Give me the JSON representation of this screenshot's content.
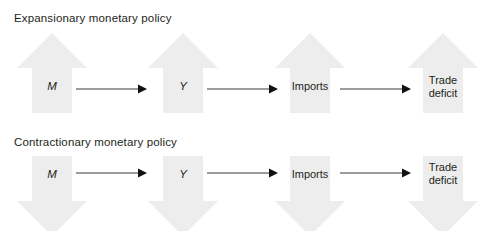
{
  "diagram": {
    "title_row1": "Expansionary monetary policy",
    "title_row2": "Contractionary monetary policy",
    "arrow_fill": "#ededed",
    "text_color": "#231f20",
    "connector_color": "#3a3a3a",
    "background": "#ffffff"
  },
  "rows": [
    {
      "id": "expansionary",
      "title": "Expansionary monetary policy",
      "direction": "up",
      "nodes": [
        {
          "label": "M",
          "italic": true
        },
        {
          "label": "Y",
          "italic": true
        },
        {
          "label": "Imports",
          "italic": false
        },
        {
          "label": "Trade\ndeficit",
          "italic": false
        }
      ],
      "connectors": [
        "arrow-right",
        "arrow-right",
        "arrow-right"
      ]
    },
    {
      "id": "contractionary",
      "title": "Contractionary monetary policy",
      "direction": "down",
      "nodes": [
        {
          "label": "M",
          "italic": true
        },
        {
          "label": "Y",
          "italic": true
        },
        {
          "label": "Imports",
          "italic": false
        },
        {
          "label": "Trade\ndeficit",
          "italic": false
        }
      ],
      "connectors": [
        "arrow-right",
        "arrow-right",
        "arrow-right"
      ]
    }
  ]
}
